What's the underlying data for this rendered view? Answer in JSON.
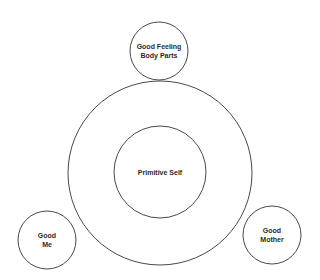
{
  "diagram": {
    "type": "concentric-and-satellite-circles",
    "stroke_color": "#333333",
    "background": "#ffffff",
    "nodes": [
      {
        "id": "outer-self-ring",
        "label": "",
        "cx": 160,
        "cy": 173,
        "r": 92
      },
      {
        "id": "primitive-self",
        "label_lines": [
          "Primitive Self"
        ],
        "cx": 160,
        "cy": 172,
        "r": 46
      },
      {
        "id": "good-feeling-body-parts",
        "label_lines": [
          "Good Feeling",
          "Body Parts"
        ],
        "cx": 159,
        "cy": 51,
        "r": 29
      },
      {
        "id": "good-me",
        "label_lines": [
          "Good",
          "Me"
        ],
        "cx": 47,
        "cy": 240,
        "r": 29
      },
      {
        "id": "good-mother",
        "label_lines": [
          "Good",
          "Mother"
        ],
        "cx": 272,
        "cy": 235,
        "r": 29
      }
    ]
  },
  "labels": {
    "primitive_self": "Primitive Self",
    "good_feeling_line1": "Good Feeling",
    "good_feeling_line2": "Body Parts",
    "good_me_line1": "Good",
    "good_me_line2": "Me",
    "good_mother_line1": "Good",
    "good_mother_line2": "Mother"
  }
}
